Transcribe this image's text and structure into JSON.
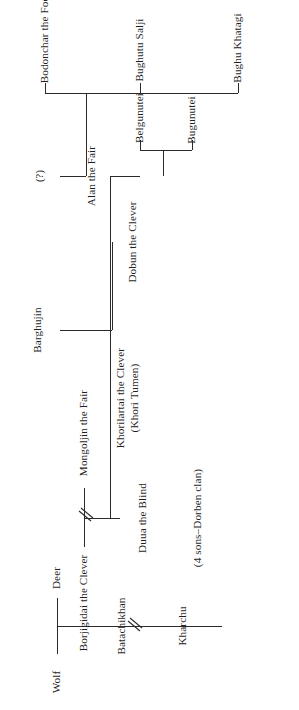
{
  "figure": {
    "kind": "genealogy-tree",
    "orientation": "rotated-90-ccw",
    "background_color": "#ffffff",
    "line_color": "#2b2b2b",
    "text_color": "#1f1f1f"
  },
  "nodes": {
    "wolf": {
      "label": "Wolf"
    },
    "deer": {
      "label": "Deer"
    },
    "batachikhan": {
      "label": "Batachikhan"
    },
    "kharchu": {
      "label": "Kharchu"
    },
    "borjigidai": {
      "label": "Borjigidai the Clever"
    },
    "mongoljin": {
      "label": "Mongoljin the Fair"
    },
    "duua": {
      "label": "Duua the Blind"
    },
    "duua_note": {
      "label": "(4 sons–Dorben clan)"
    },
    "dobun": {
      "label": "Dobun the Clever"
    },
    "khorilartai": {
      "label": "Khorilartai the Clever",
      "sub": "(Khori Tumen)"
    },
    "barghujin": {
      "label": "Barghujin"
    },
    "alan": {
      "label": "Alan the Fair"
    },
    "unknown_father": {
      "label": "(?)"
    },
    "bugunutei": {
      "label": "Bugunutei"
    },
    "belgunutei": {
      "label": "Belgunutei"
    },
    "bughu_khatagi": {
      "label": "Bughu Khatagi"
    },
    "bughutu_salji": {
      "label": "Bughutu Salji"
    },
    "bodonchar": {
      "label": "Bodonchar the Fool"
    }
  },
  "marriages": [
    {
      "name": "wolf-deer",
      "partners": [
        "Wolf",
        "Deer"
      ]
    },
    {
      "name": "borjigidai-mongoljin",
      "partners": [
        "Borjigidai the Clever",
        "Mongoljin the Fair"
      ],
      "break_mark": true
    },
    {
      "name": "khorilartai-barghujin",
      "partners": [
        "Khorilartai the Clever",
        "Barghujin"
      ]
    },
    {
      "name": "dobun-alan",
      "partners": [
        "Dobun the Clever",
        "Alan the Fair"
      ]
    },
    {
      "name": "unknown-alan",
      "partners": [
        "(?)",
        "Alan the Fair"
      ]
    }
  ],
  "generation_breaks": [
    {
      "name": "batachikhan-to-kharchu",
      "symbol": "//"
    },
    {
      "name": "borjigidai-to-mongoljin",
      "symbol": "//"
    }
  ],
  "descent": [
    {
      "parent": "Wolf / Deer",
      "children": [
        "Batachikhan"
      ]
    },
    {
      "parent": "Batachikhan",
      "children": [
        "Kharchu"
      ],
      "break": true
    },
    {
      "parent": "Kharchu",
      "children": [
        "Borjigidai the Clever"
      ]
    },
    {
      "parent": "Borjigidai the Clever / Mongoljin the Fair",
      "children": [
        "Duua the Blind",
        "Dobun the Clever"
      ]
    },
    {
      "parent": "Duua the Blind",
      "children": [
        "(4 sons–Dorben clan)"
      ]
    },
    {
      "parent": "Khorilartai the Clever / Barghujin",
      "children": [
        "Alan the Fair"
      ]
    },
    {
      "parent": "Dobun the Clever / Alan the Fair",
      "children": [
        "Bugunutei",
        "Belgunutei"
      ]
    },
    {
      "parent": "(?) / Alan the Fair",
      "children": [
        "Bughu Khatagi",
        "Bughutu Salji",
        "Bodonchar the Fool"
      ]
    }
  ]
}
